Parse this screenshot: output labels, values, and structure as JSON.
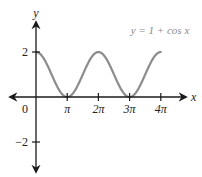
{
  "chart_data": {
    "type": "line",
    "title": "",
    "annotation": "y = 1 + cos x",
    "xlabel": "x",
    "ylabel": "y",
    "origin_label": "0",
    "x_ticks": [
      {
        "value": 3.14159,
        "label": "π"
      },
      {
        "value": 6.28319,
        "label": "2π"
      },
      {
        "value": 9.42478,
        "label": "3π"
      },
      {
        "value": 12.56637,
        "label": "4π"
      }
    ],
    "y_ticks": [
      {
        "value": 2,
        "label": "2"
      },
      {
        "value": -2,
        "label": "−2"
      }
    ],
    "xlim": [
      -1,
      14
    ],
    "ylim": [
      -3.3,
      3.4
    ],
    "grid": false,
    "legend": "none",
    "series": [
      {
        "name": "y = 1 + cos x",
        "function": "1 + cos(x)",
        "x_range": [
          0,
          12.56637
        ],
        "x": [
          0,
          1.5708,
          3.14159,
          4.71239,
          6.28319,
          7.85398,
          9.42478,
          10.99557,
          12.56637
        ],
        "y": [
          2,
          1,
          0,
          1,
          2,
          1,
          0,
          1,
          2
        ],
        "color": "#8c8c8c"
      }
    ]
  },
  "colors": {
    "axis": "#1a1a1a",
    "curve": "#8c8c8c",
    "annotation": "#8a8a8a",
    "text": "#222222"
  }
}
